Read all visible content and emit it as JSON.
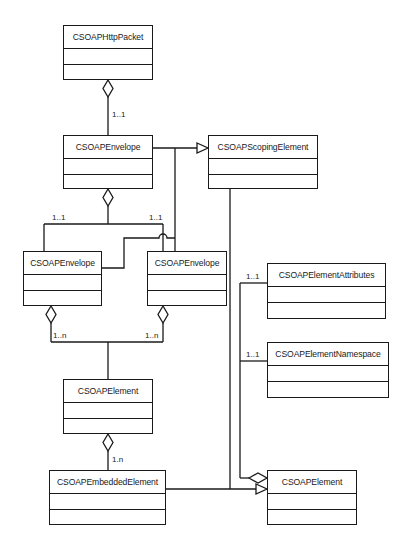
{
  "diagram": {
    "type": "UML class diagram",
    "classes": [
      {
        "id": "http_packet",
        "name": "CSOAPHttpPacket",
        "x": 63,
        "y": 25,
        "w": 90,
        "h": 55
      },
      {
        "id": "envelope_top",
        "name": "CSOAPEnvelope",
        "x": 63,
        "y": 135,
        "w": 90,
        "h": 54
      },
      {
        "id": "scoping",
        "name": "CSOAPScopingElement",
        "x": 208,
        "y": 135,
        "w": 110,
        "h": 54
      },
      {
        "id": "envelope_left",
        "name": "CSOAPEnvelope",
        "x": 23,
        "y": 251,
        "w": 79,
        "h": 55
      },
      {
        "id": "envelope_right",
        "name": "CSOAPEnvelope",
        "x": 147,
        "y": 251,
        "w": 80,
        "h": 55
      },
      {
        "id": "attributes",
        "name": "CSOAPElementAttributes",
        "x": 267,
        "y": 263,
        "w": 119,
        "h": 56
      },
      {
        "id": "namespace",
        "name": "CSOAPElementNamespace",
        "x": 267,
        "y": 342,
        "w": 122,
        "h": 56
      },
      {
        "id": "element_mid",
        "name": "CSOAPElement",
        "x": 63,
        "y": 379,
        "w": 90,
        "h": 55
      },
      {
        "id": "embedded",
        "name": "CSOAPEmbeddedElement",
        "x": 49,
        "y": 470,
        "w": 117,
        "h": 55
      },
      {
        "id": "element_right",
        "name": "CSOAPElement",
        "x": 267,
        "y": 470,
        "w": 90,
        "h": 55
      }
    ],
    "multiplicities": [
      {
        "label": "1..1",
        "x": 112,
        "y": 110
      },
      {
        "label": "1..1",
        "x": 52,
        "y": 216
      },
      {
        "label": "1..1",
        "x": 149,
        "y": 216
      },
      {
        "label": "1..n",
        "x": 53,
        "y": 334
      },
      {
        "label": "1..n",
        "x": 145,
        "y": 334
      },
      {
        "label": "1..1",
        "x": 246,
        "y": 266
      },
      {
        "label": "1..1",
        "x": 246,
        "y": 344
      },
      {
        "label": "1.n",
        "x": 112,
        "y": 454
      }
    ],
    "relationships": [
      {
        "from": "CSOAPHttpPacket",
        "to": "CSOAPEnvelope",
        "kind": "aggregation",
        "multiplicity": "1..1"
      },
      {
        "from": "CSOAPEnvelope",
        "to": "CSOAPScopingElement",
        "kind": "generalization"
      },
      {
        "from": "CSOAPEnvelope",
        "to": "CSOAPEnvelope (left)",
        "kind": "aggregation",
        "multiplicity": "1..1"
      },
      {
        "from": "CSOAPEnvelope",
        "to": "CSOAPEnvelope (right)",
        "kind": "aggregation",
        "multiplicity": "1..1"
      },
      {
        "from": "CSOAPEnvelope (left)",
        "to": "CSOAPElement",
        "kind": "aggregation",
        "multiplicity": "1..n"
      },
      {
        "from": "CSOAPEnvelope (right)",
        "to": "CSOAPElement",
        "kind": "aggregation",
        "multiplicity": "1..n"
      },
      {
        "from": "CSOAPElement",
        "to": "CSOAPEmbeddedElement",
        "kind": "aggregation",
        "multiplicity": "1.n"
      },
      {
        "from": "CSOAPEmbeddedElement",
        "to": "CSOAPElement (right)",
        "kind": "generalization"
      },
      {
        "from": "CSOAPScopingElement",
        "to": "CSOAPElement (right)",
        "kind": "generalization"
      },
      {
        "from": "CSOAPElement (right)",
        "to": "CSOAPElementAttributes",
        "kind": "aggregation",
        "multiplicity": "1..1"
      },
      {
        "from": "CSOAPElement (right)",
        "to": "CSOAPElementNamespace",
        "kind": "aggregation",
        "multiplicity": "1..1"
      }
    ],
    "colors": {
      "line": "#1a1a1a",
      "background": "#ffffff"
    }
  }
}
